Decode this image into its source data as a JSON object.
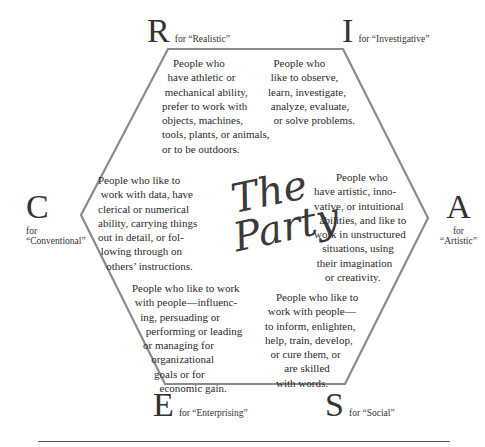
{
  "title": {
    "line1": "The",
    "line2": "Party"
  },
  "types": {
    "R": {
      "letter": "R",
      "label": "for “Realistic”",
      "desc": "    People who\n  have athletic or\n mechanical ability,\nprefer to work with\nobjects, machines,\ntools, plants, or animals,\nor to be outdoors."
    },
    "I": {
      "letter": "I",
      "label": "for “Investigative”",
      "desc": "  People who\n like to observe,\nlearn, investigate,\n analyze, evaluate,\n  or solve problems."
    },
    "C": {
      "letter": "C",
      "label_line1": "for",
      "label_line2": "“Conventional”",
      "desc": "People who like to\n work with data, have\nclerical or numerical\nability, carrying things\nout in detail, or fol-\n lowing through on\n   others’ instructions."
    },
    "A": {
      "letter": "A",
      "label_line1": "for",
      "label_line2": "“Artistic”",
      "desc": "        People who\nhave artistic, inno-\nvative, or intuitional\n  abilities, and like to\nwork in unstructured\n   situations, using\n their imagination\n    or creativity."
    },
    "E": {
      "letter": "E",
      "label": "for “Enterprising”",
      "desc": "People who like to work\n with people—influenc-\n   ing, persuading or\n     performing or leading\n    or managing for\n       organizational\n        goals or for\n          economic gain."
    },
    "S": {
      "letter": "S",
      "label": "for “Social”",
      "desc": "    People who like to\n work with people—\nto inform, enlighten,\nhelp, train, develop,\n  or cure them, or\n       are skilled\n    with words."
    }
  },
  "colors": {
    "hexagon_stroke": "#8a8a8a",
    "text": "#2a2a2a",
    "rule": "#555555"
  }
}
